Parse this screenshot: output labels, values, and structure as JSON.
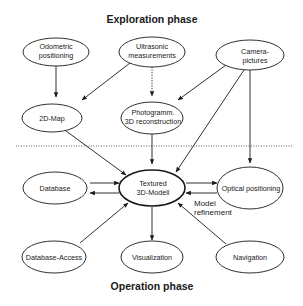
{
  "diagram": {
    "phases": {
      "exploration": "Exploration phase",
      "operation": "Operation phase"
    },
    "nodes": {
      "odometric": [
        "Odometric",
        "positioning"
      ],
      "ultrasonic": [
        "Ultrasonic",
        "measurements"
      ],
      "camera": [
        "Camera-",
        "pictures"
      ],
      "map2d": [
        "2D-Map"
      ],
      "photogramm": [
        "Photogramm.",
        "3D reconstruction"
      ],
      "textured": [
        "Textured",
        "3D-Modell"
      ],
      "database": [
        "Database"
      ],
      "optical": [
        "Optical positioning"
      ],
      "dbaccess": [
        "Database-Access"
      ],
      "visualization": [
        "Visualization"
      ],
      "navigation": [
        "Navigation"
      ]
    },
    "annotations": {
      "model_refinement": [
        "Model",
        "refinement"
      ]
    },
    "edges": [
      {
        "from": "odometric",
        "to": "map2d",
        "style": "solid"
      },
      {
        "from": "ultrasonic",
        "to": "map2d",
        "style": "solid"
      },
      {
        "from": "ultrasonic",
        "to": "photogramm",
        "style": "dotted"
      },
      {
        "from": "camera",
        "to": "photogramm",
        "style": "solid"
      },
      {
        "from": "camera",
        "to": "textured",
        "style": "solid"
      },
      {
        "from": "camera",
        "to": "optical",
        "style": "solid"
      },
      {
        "from": "map2d",
        "to": "textured",
        "style": "solid"
      },
      {
        "from": "photogramm",
        "to": "textured",
        "style": "solid"
      },
      {
        "from": "database",
        "to": "textured",
        "style": "solid"
      },
      {
        "from": "textured",
        "to": "database",
        "style": "solid"
      },
      {
        "from": "textured",
        "to": "optical",
        "style": "solid"
      },
      {
        "from": "optical",
        "to": "textured",
        "style": "solid"
      },
      {
        "from": "dbaccess",
        "to": "textured",
        "style": "solid"
      },
      {
        "from": "textured",
        "to": "visualization",
        "style": "solid"
      },
      {
        "from": "navigation",
        "to": "textured",
        "style": "solid"
      }
    ]
  }
}
